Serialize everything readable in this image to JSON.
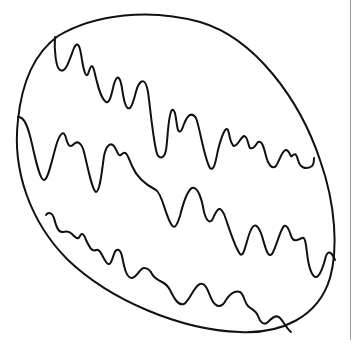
{
  "page": {
    "colors": {
      "background": "#ffffff",
      "ink": "#111111",
      "edge_line": "#9a9a9a"
    }
  },
  "egg": {
    "label": "egg-outline",
    "stripes": [
      {
        "name": "top-stripe"
      },
      {
        "name": "middle-stripe"
      },
      {
        "name": "bottom-stripe"
      }
    ]
  }
}
